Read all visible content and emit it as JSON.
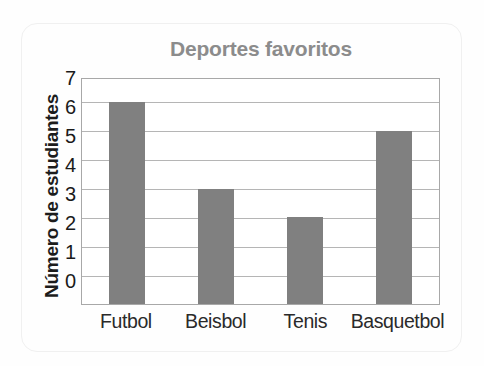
{
  "chart_data": {
    "type": "bar",
    "title": "Deportes favoritos",
    "xlabel": "",
    "ylabel": "Número de estudiantes",
    "categories": [
      "Futbol",
      "Beisbol",
      "Tenis",
      "Basquetbol"
    ],
    "values": [
      7,
      4,
      3,
      6
    ],
    "ylim": [
      0,
      7.8
    ],
    "yticks": [
      7,
      6,
      5,
      4,
      3,
      2,
      1,
      0
    ],
    "grid": true,
    "legend": false,
    "colors": {
      "bar_fill": "#808080",
      "title_text": "#8c8c8c",
      "axis_label_text": "#1c1c1c",
      "tick_text": "#1a1a1a",
      "gridline": "#b5b5b5",
      "frame": "#a8a8a8",
      "background": "#ffffff"
    }
  }
}
